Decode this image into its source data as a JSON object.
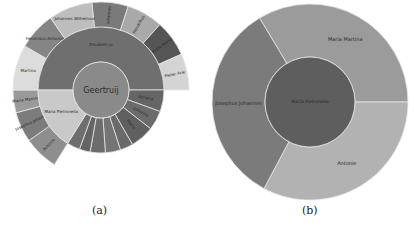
{
  "figure": {
    "captions": {
      "a": "(a)",
      "b": "(b)"
    }
  },
  "chart_data": [
    {
      "id": "a",
      "type": "sunburst",
      "title": "",
      "center": {
        "x": 101,
        "y": 90
      },
      "root": {
        "label": "Geertruij",
        "color": "#8a8a8a",
        "r": 28
      },
      "ring1": {
        "r0": 28,
        "r1": 63,
        "segments": [
          {
            "label": "Elisabeth Jo",
            "start": -90,
            "end": 90,
            "color": "#6f6f6f"
          },
          {
            "label": "Adriana",
            "start": 90,
            "end": 110,
            "color": "#656565"
          },
          {
            "label": "Johanna",
            "start": 110,
            "end": 128,
            "color": "#6b6b6b"
          },
          {
            "label": "Maria",
            "start": 128,
            "end": 150,
            "color": "#606060"
          },
          {
            "label": "",
            "start": 150,
            "end": 162,
            "color": "#6a6a6a"
          },
          {
            "label": "",
            "start": 162,
            "end": 176,
            "color": "#747474"
          },
          {
            "label": "",
            "start": 176,
            "end": 190,
            "color": "#6c6c6c"
          },
          {
            "label": "",
            "start": 190,
            "end": 200,
            "color": "#646464"
          },
          {
            "label": "",
            "start": 200,
            "end": 212,
            "color": "#6e6e6e"
          },
          {
            "label": "Maria Pietronella",
            "start": 212,
            "end": 270,
            "color": "#c9c9c9"
          }
        ]
      },
      "ring2": {
        "r0": 63,
        "r1": 88,
        "segments": [
          {
            "label": "Johannes",
            "start": -6,
            "end": 18,
            "color": "#7a7a7a"
          },
          {
            "label": "Hendrikus",
            "start": 18,
            "end": 42,
            "color": "#a9a9a9"
          },
          {
            "label": "Anna Maria",
            "start": 42,
            "end": 66,
            "color": "#555555"
          },
          {
            "label": "Pieter Arie",
            "start": 66,
            "end": 90,
            "color": "#d4d4d4"
          },
          {
            "label": "Antonie",
            "start": 212,
            "end": 235,
            "color": "#8e8e8e"
          },
          {
            "label": "Josephus Johannes",
            "start": 235,
            "end": 255,
            "color": "#7c7c7c"
          },
          {
            "label": "Maria Martina",
            "start": 255,
            "end": 270,
            "color": "#9a9a9a"
          },
          {
            "label": "Martina",
            "start": 270,
            "end": 300,
            "color": "#dcdcdc"
          },
          {
            "label": "Hendrikus Antonius",
            "start": 300,
            "end": 325,
            "color": "#858585"
          },
          {
            "label": "Johannes Wilhelmus",
            "start": 325,
            "end": 354,
            "color": "#bdbdbd"
          }
        ]
      }
    },
    {
      "id": "b",
      "type": "sunburst",
      "title": "",
      "center": {
        "x": 310,
        "y": 102
      },
      "root": {
        "label": "Maria Pietronella",
        "color": "#5e5e5e",
        "r": 45
      },
      "ring1": {
        "r0": 45,
        "r1": 98,
        "segments": [
          {
            "label": "Maria Martina",
            "start": -31,
            "end": 90,
            "color": "#9b9b9b"
          },
          {
            "label": "Antonie",
            "start": 90,
            "end": 208,
            "color": "#b2b2b2"
          },
          {
            "label": "Josephus Johannes",
            "start": 208,
            "end": 329,
            "color": "#7b7b7b"
          }
        ]
      }
    }
  ]
}
